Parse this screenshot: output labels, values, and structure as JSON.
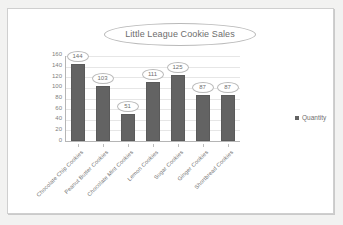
{
  "chart_data": {
    "type": "bar",
    "title": "Little League Cookie Sales",
    "xlabel": "",
    "ylabel": "",
    "ylim": [
      0,
      160
    ],
    "ytick_step": 20,
    "yticks": [
      "160",
      "140",
      "120",
      "100",
      "80",
      "60",
      "40",
      "20",
      "0"
    ],
    "grid": true,
    "legend_position": "right",
    "categories": [
      "Chocolate Chip Cookies",
      "Peanut Butter Cookies",
      "Chocolate Mint Cookies",
      "Lemon Cookies",
      "Sugar Cookies",
      "Ginger Cookies",
      "Shortbread Cookies"
    ],
    "series": [
      {
        "name": "Quantity",
        "values": [
          144,
          103,
          51,
          111,
          125,
          87,
          87
        ],
        "color": "#636363"
      }
    ],
    "data_labels": [
      "144",
      "103",
      "51",
      "111",
      "125",
      "87",
      "87"
    ]
  },
  "legend": {
    "entries": [
      {
        "label": "Quantity",
        "color": "#636363",
        "marker": "square-marker-icon"
      }
    ]
  },
  "colors": {
    "bar_fill": "#636363",
    "gridline": "#e6e6e6",
    "axis": "#b5b5b5",
    "text": "#6f6f6f",
    "frame_border": "#cfcfcf",
    "page_background": "#f2f2f1",
    "chart_background": "#ffffff"
  }
}
